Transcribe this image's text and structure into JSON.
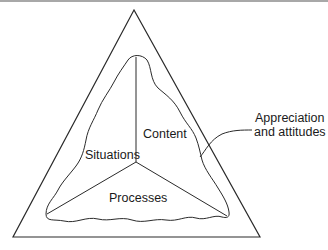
{
  "diagram": {
    "type": "triangle-model",
    "outer_shape": "triangle",
    "inner_shape": "wavy-triangle-divided-into-three-regions",
    "regions": [
      {
        "id": "content",
        "label": "Content"
      },
      {
        "id": "situations",
        "label": "Situations"
      },
      {
        "id": "processes",
        "label": "Processes"
      }
    ],
    "annotation": {
      "line1": "Appreciation",
      "line2": "and attitudes"
    },
    "colors": {
      "stroke": "#2a2a2a",
      "background": "#ffffff",
      "top_border": "#a8a8a8"
    }
  }
}
